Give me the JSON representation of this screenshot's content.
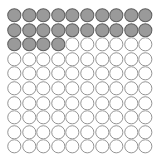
{
  "chart_data": {
    "type": "pictograph",
    "title": "",
    "subtitle": "",
    "xlabel": "",
    "ylabel": "",
    "grid": {
      "rows": 10,
      "columns": 10,
      "total_units": 100
    },
    "unit_shape": "circle",
    "packing": "touching",
    "fill_order": "row-major-top-left",
    "categories": [
      "filled",
      "empty"
    ],
    "values": [
      24,
      76
    ],
    "series": [
      {
        "name": "filled",
        "value": 24,
        "percent": 24,
        "color": "#9a9a9a",
        "stroke": "#5f5f5f"
      },
      {
        "name": "empty",
        "value": 76,
        "percent": 76,
        "color": "#ffffff",
        "stroke": "#8a8a8a"
      }
    ],
    "row_fill_counts": [
      10,
      10,
      4,
      0,
      0,
      0,
      0,
      0,
      0,
      0
    ],
    "cells": [
      [
        1,
        1,
        1,
        1,
        1,
        1,
        1,
        1,
        1,
        1
      ],
      [
        1,
        1,
        1,
        1,
        1,
        1,
        1,
        1,
        1,
        1
      ],
      [
        1,
        1,
        1,
        1,
        0,
        0,
        0,
        0,
        0,
        0
      ],
      [
        0,
        0,
        0,
        0,
        0,
        0,
        0,
        0,
        0,
        0
      ],
      [
        0,
        0,
        0,
        0,
        0,
        0,
        0,
        0,
        0,
        0
      ],
      [
        0,
        0,
        0,
        0,
        0,
        0,
        0,
        0,
        0,
        0
      ],
      [
        0,
        0,
        0,
        0,
        0,
        0,
        0,
        0,
        0,
        0
      ],
      [
        0,
        0,
        0,
        0,
        0,
        0,
        0,
        0,
        0,
        0
      ],
      [
        0,
        0,
        0,
        0,
        0,
        0,
        0,
        0,
        0,
        0
      ],
      [
        0,
        0,
        0,
        0,
        0,
        0,
        0,
        0,
        0,
        0
      ]
    ],
    "legend": {
      "show": false,
      "position": "none",
      "entries": []
    },
    "axes": {
      "show": false
    },
    "gridlines": false,
    "background": "#ffffff"
  }
}
